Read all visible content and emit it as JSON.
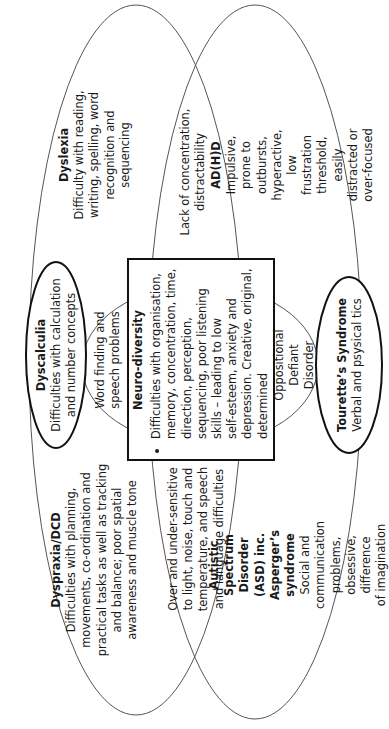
{
  "diagram": {
    "orientation": "rotated -90deg",
    "colors": {
      "stroke": "#555555",
      "bold_stroke": "#111111",
      "text": "#1a1a1a",
      "background": "#ffffff"
    },
    "regions": {
      "dyslexia": {
        "title": "Dyslexia",
        "text": "Difficulty with reading,\nwriting, spelling, word\nrecognition and\nsequencing"
      },
      "dyslexia_adhd_overlap": {
        "text": "Lack of concentration,\ndistractability"
      },
      "adhd": {
        "title": "AD(H)D",
        "text": "Impulsive, prone to\noutbursts, hyperactive, low\nfrustration threshold, easily\ndistracted or over-focused"
      },
      "dyscalculia": {
        "title": "Dyscalculia",
        "text": "Difficulties with calculation\nand number concepts"
      },
      "word_finding": {
        "text": "Word finding and\nspeech problems"
      },
      "neurodiversity": {
        "title": "Neuro-diversity",
        "bullet": "Difficulties with organisation,\nmemory, concentration, time,\ndirection, perception,\nsequencing, poor listening\nskills – leading to low\nself-esteem, anxiety and\ndepression. Creative, original,\ndetermined"
      },
      "oppositional": {
        "text": "Oppositional\nDefiant Disorder"
      },
      "tourettes": {
        "title": "Tourette’s Syndrome",
        "text": "Verbal and psysical tics"
      },
      "dyspraxia": {
        "title": "Dyspraxia/DCD",
        "text": "Difficulties with planning,\nmovements, co-ordination and\npractical tasks as well as tracking\nand balance; poor spatial\nawareness and muscle tone"
      },
      "dyspraxia_asd_overlap": {
        "text": "Over and under-sensitive\nto light, noise, touch and\ntemperature, and speech\nand language difficulties"
      },
      "asd": {
        "title": "Autistic Spectrum Disorder\n(ASD) inc. Asperger’s syndrome",
        "text": "Social and communication\nproblems, obsessive, difference\nof imagination"
      }
    }
  }
}
